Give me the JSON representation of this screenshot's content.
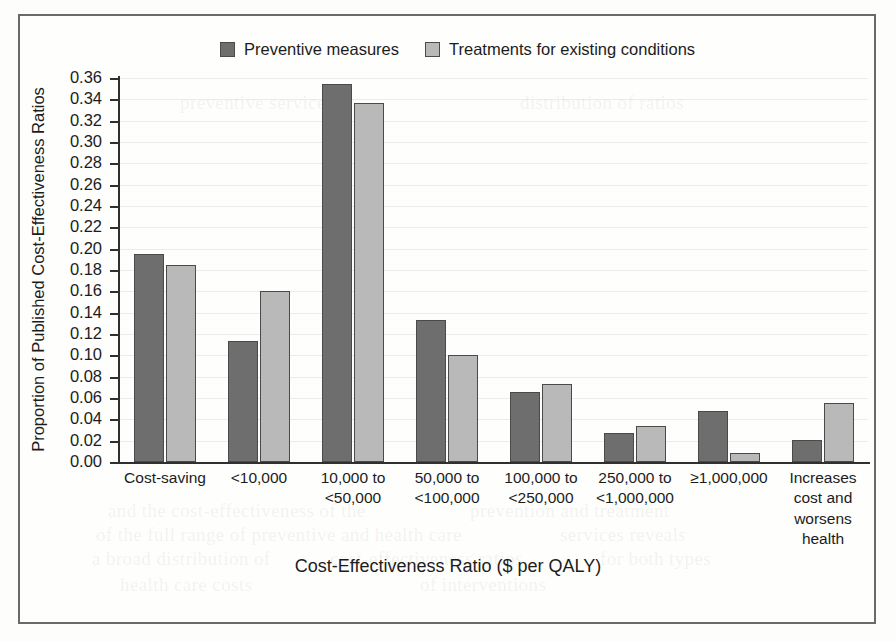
{
  "figure": {
    "frame_border_color": "#6a6a6a",
    "background": "#fdfdfb"
  },
  "legend": {
    "items": [
      {
        "label": "Preventive measures",
        "color": "#6e6e6e",
        "swatch_name": "legend-swatch-preventive"
      },
      {
        "label": "Treatments for existing conditions",
        "color": "#b9b9b9",
        "swatch_name": "legend-swatch-treatments"
      }
    ]
  },
  "ghost_text": [
    {
      "text": "and the cost-effectiveness of the",
      "x": 108,
      "y": 500
    },
    {
      "text": "prevention and treatment",
      "x": 470,
      "y": 500
    },
    {
      "text": "of the full range of preventive and health care",
      "x": 96,
      "y": 524
    },
    {
      "text": "services reveals",
      "x": 560,
      "y": 524
    },
    {
      "text": "a broad distribution of",
      "x": 92,
      "y": 548
    },
    {
      "text": "cost-effectiveness ratios",
      "x": 330,
      "y": 548
    },
    {
      "text": "for both types",
      "x": 600,
      "y": 548
    },
    {
      "text": "health care costs",
      "x": 120,
      "y": 574
    },
    {
      "text": "of interventions",
      "x": 420,
      "y": 574
    },
    {
      "text": "preventive services",
      "x": 180,
      "y": 92
    },
    {
      "text": "distribution of ratios",
      "x": 520,
      "y": 92
    }
  ],
  "chart_data": {
    "type": "bar",
    "title": "",
    "xlabel": "Cost-Effectiveness Ratio ($ per QALY)",
    "ylabel": "Proportion of Published Cost-Effectiveness Ratios",
    "ylim": [
      0.0,
      0.36
    ],
    "ytick_step": 0.02,
    "ytick_labels": [
      "0.36",
      "0.34",
      "0.32",
      "0.30",
      "0.28",
      "0.26",
      "0.24",
      "0.22",
      "0.20",
      "0.18",
      "0.16",
      "0.14",
      "0.12",
      "0.10",
      "0.08",
      "0.06",
      "0.04",
      "0.02",
      "0.00"
    ],
    "ytick_values": [
      0.36,
      0.34,
      0.32,
      0.3,
      0.28,
      0.26,
      0.24,
      0.22,
      0.2,
      0.18,
      0.16,
      0.14,
      0.12,
      0.1,
      0.08,
      0.06,
      0.04,
      0.02,
      0.0
    ],
    "grid": true,
    "legend_position": "top-center",
    "categories": [
      "Cost-saving",
      "<10,000",
      "10,000 to\n<50,000",
      "50,000 to\n<100,000",
      "100,000 to\n<250,000",
      "250,000 to\n<1,000,000",
      "≥1,000,000",
      "Increases\ncost and\nworsens\nhealth"
    ],
    "category_lines": [
      [
        "Cost-saving"
      ],
      [
        "<10,000"
      ],
      [
        "10,000 to",
        "<50,000"
      ],
      [
        "50,000 to",
        "<100,000"
      ],
      [
        "100,000 to",
        "<250,000"
      ],
      [
        "250,000 to",
        "<1,000,000"
      ],
      [
        "≥1,000,000"
      ],
      [
        "Increases",
        "cost and",
        "worsens",
        "health"
      ]
    ],
    "series": [
      {
        "name": "Preventive measures",
        "color": "#6e6e6e",
        "values": [
          0.195,
          0.113,
          0.354,
          0.133,
          0.066,
          0.027,
          0.048,
          0.021
        ]
      },
      {
        "name": "Treatments for existing conditions",
        "color": "#b9b9b9",
        "values": [
          0.185,
          0.16,
          0.337,
          0.1,
          0.073,
          0.034,
          0.008,
          0.055
        ]
      }
    ]
  }
}
